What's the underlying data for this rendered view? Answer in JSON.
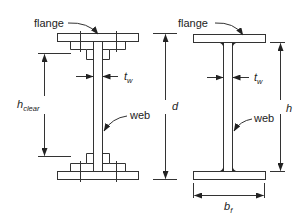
{
  "figure": {
    "left_section": {
      "name": "built-up plate girder",
      "labels": {
        "flange": "flange",
        "web": "web",
        "web_thickness_symbol": "t",
        "web_thickness_sub": "w",
        "clear_height_symbol": "h",
        "clear_height_sub": "clear"
      }
    },
    "right_section": {
      "name": "rolled wide-flange beam",
      "labels": {
        "flange": "flange",
        "web": "web",
        "web_thickness_symbol": "t",
        "web_thickness_sub": "w",
        "depth_symbol": "d",
        "web_height_symbol": "h",
        "flange_width_symbol": "b",
        "flange_width_sub": "f"
      }
    }
  }
}
